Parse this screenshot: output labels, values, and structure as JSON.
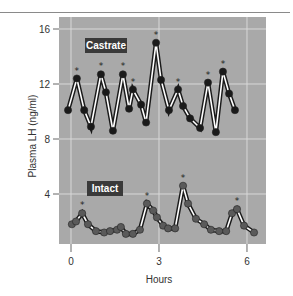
{
  "chart_data": {
    "type": "line",
    "title": "",
    "xlabel": "Hours",
    "ylabel": "Plasma LH (ng/ml)",
    "xlim": [
      -0.4,
      6.65
    ],
    "ylim": [
      0,
      16.8
    ],
    "x_ticks": [
      0,
      3,
      6
    ],
    "x_tick_labels": [
      "0",
      "3",
      "6"
    ],
    "y_ticks": [
      4,
      8,
      12,
      16
    ],
    "y_tick_labels": [
      "4",
      "8",
      "12",
      "16"
    ],
    "grid": true,
    "legend": "none (inline panel labels)",
    "annotations": [
      "Castrate",
      "Intact",
      "* marks detected pulses"
    ],
    "series": [
      {
        "name": "Castrate",
        "x": [
          -0.1,
          0.2,
          0.45,
          0.68,
          1.02,
          1.19,
          1.43,
          1.77,
          1.98,
          2.11,
          2.39,
          2.56,
          2.9,
          3.07,
          3.34,
          3.65,
          3.82,
          4.06,
          4.4,
          4.67,
          4.94,
          5.18,
          5.39,
          5.59
        ],
        "values": [
          10.1,
          12.4,
          10.1,
          8.9,
          12.7,
          11.4,
          8.6,
          12.7,
          10.2,
          11.6,
          10.5,
          9.2,
          15.0,
          12.3,
          10.1,
          11.6,
          10.4,
          9.5,
          8.8,
          12.1,
          8.5,
          12.9,
          11.3,
          10.1
        ],
        "pulse_markers": [
          1,
          4,
          7,
          9,
          12,
          15,
          19,
          21
        ]
      },
      {
        "name": "Intact",
        "x": [
          0.03,
          0.17,
          0.38,
          0.58,
          0.85,
          1.13,
          1.33,
          1.57,
          1.7,
          1.87,
          2.11,
          2.35,
          2.59,
          2.8,
          2.93,
          3.14,
          3.31,
          3.55,
          3.82,
          3.99,
          4.26,
          4.54,
          4.77,
          5.05,
          5.29,
          5.49,
          5.66,
          5.9,
          6.24
        ],
        "values": [
          1.8,
          2.0,
          2.6,
          1.8,
          1.3,
          1.2,
          1.3,
          1.4,
          1.6,
          1.1,
          1.1,
          1.4,
          3.3,
          2.8,
          2.3,
          1.7,
          1.5,
          1.5,
          4.6,
          3.3,
          2.2,
          1.8,
          1.4,
          1.3,
          1.3,
          2.6,
          2.9,
          1.7,
          1.2
        ],
        "pulse_markers": [
          2,
          12,
          18,
          26
        ]
      }
    ]
  },
  "labels": {
    "castrate": "Castrate",
    "intact": "Intact",
    "xlabel": "Hours",
    "ylabel": "Plasma LH (ng/ml)",
    "pulse_symbol": "*"
  },
  "colors": {
    "panel_bg": "#a9a9a9",
    "grid": "#d8d8d8",
    "castrate_marker": "#1a1a1a",
    "intact_marker": "#5a5a5a",
    "label_box": "#3a3a3a",
    "line_outer": "#1a1a1a",
    "line_inner": "#ffffff"
  }
}
